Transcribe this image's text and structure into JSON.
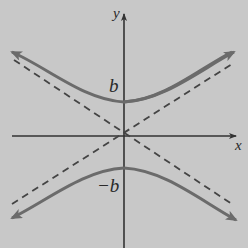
{
  "figure": {
    "colors": {
      "background": "#c8c8c8",
      "axis": "#333333",
      "curve": "#6b6b6b",
      "asymptote": "#444444",
      "text": "#2a2a2a"
    },
    "labels": {
      "x_axis": "x",
      "y_axis": "y",
      "upper_vertex": "b",
      "lower_vertex": "−b"
    },
    "elements": {
      "axes": [
        "x-axis",
        "y-axis"
      ],
      "curves": [
        "upper branch",
        "lower branch"
      ],
      "asymptotes": [
        "dashed line with positive slope",
        "dashed line with negative slope"
      ]
    }
  }
}
